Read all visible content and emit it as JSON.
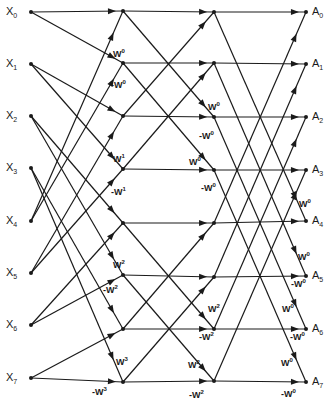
{
  "diagram": {
    "stroke_color": "#1a1a1a",
    "background": "#ffffff",
    "columns_x": [
      31,
      123,
      214,
      306
    ],
    "rows_y": {
      "inputs": [
        12,
        64,
        116,
        168,
        221,
        273,
        325,
        378
      ],
      "stage1": [
        11,
        63,
        116,
        169,
        223,
        275,
        329,
        382
      ],
      "stage2": [
        12,
        63,
        117,
        170,
        223,
        277,
        329,
        381
      ],
      "outputs": [
        12,
        64,
        117,
        170,
        221,
        276,
        329,
        382
      ]
    },
    "inputs": [
      {
        "base": "X",
        "sub": "0"
      },
      {
        "base": "X",
        "sub": "1"
      },
      {
        "base": "X",
        "sub": "2"
      },
      {
        "base": "X",
        "sub": "3"
      },
      {
        "base": "X",
        "sub": "4"
      },
      {
        "base": "X",
        "sub": "5"
      },
      {
        "base": "X",
        "sub": "6"
      },
      {
        "base": "X",
        "sub": "7"
      }
    ],
    "outputs": [
      {
        "base": "A",
        "sub": "0"
      },
      {
        "base": "A",
        "sub": "1"
      },
      {
        "base": "A",
        "sub": "2"
      },
      {
        "base": "A",
        "sub": "3"
      },
      {
        "base": "A",
        "sub": "4"
      },
      {
        "base": "A",
        "sub": "5"
      },
      {
        "base": "A",
        "sub": "6"
      },
      {
        "base": "A",
        "sub": "7"
      }
    ],
    "edges": {
      "stage1": [
        [
          0,
          0
        ],
        [
          0,
          1
        ],
        [
          4,
          0
        ],
        [
          4,
          1
        ],
        [
          1,
          2
        ],
        [
          1,
          3
        ],
        [
          5,
          2
        ],
        [
          5,
          3
        ],
        [
          2,
          4
        ],
        [
          2,
          5
        ],
        [
          6,
          4
        ],
        [
          6,
          5
        ],
        [
          3,
          6
        ],
        [
          3,
          7
        ],
        [
          7,
          6
        ],
        [
          7,
          7
        ]
      ],
      "stage2": [
        [
          0,
          0
        ],
        [
          0,
          2
        ],
        [
          2,
          0
        ],
        [
          2,
          2
        ],
        [
          1,
          1
        ],
        [
          1,
          3
        ],
        [
          3,
          1
        ],
        [
          3,
          3
        ],
        [
          4,
          4
        ],
        [
          4,
          6
        ],
        [
          6,
          4
        ],
        [
          6,
          6
        ],
        [
          5,
          5
        ],
        [
          5,
          7
        ],
        [
          7,
          5
        ],
        [
          7,
          7
        ]
      ],
      "stage3": [
        [
          0,
          0
        ],
        [
          0,
          4
        ],
        [
          4,
          0
        ],
        [
          4,
          4
        ],
        [
          1,
          1
        ],
        [
          1,
          5
        ],
        [
          5,
          1
        ],
        [
          5,
          5
        ],
        [
          2,
          2
        ],
        [
          2,
          6
        ],
        [
          6,
          2
        ],
        [
          6,
          6
        ],
        [
          3,
          3
        ],
        [
          3,
          7
        ],
        [
          7,
          3
        ],
        [
          7,
          7
        ]
      ]
    },
    "twiddle_labels": [
      {
        "sign": "",
        "exp": "0",
        "x": 113,
        "y": 57
      },
      {
        "sign": "-",
        "exp": "0",
        "x": 111,
        "y": 88
      },
      {
        "sign": "",
        "exp": "1",
        "x": 113,
        "y": 162
      },
      {
        "sign": "-",
        "exp": "1",
        "x": 111,
        "y": 195
      },
      {
        "sign": "",
        "exp": "2",
        "x": 113,
        "y": 268
      },
      {
        "sign": "-",
        "exp": "2",
        "x": 103,
        "y": 293
      },
      {
        "sign": "",
        "exp": "3",
        "x": 116,
        "y": 365
      },
      {
        "sign": "-",
        "exp": "3",
        "x": 92,
        "y": 395
      },
      {
        "sign": "",
        "exp": "0",
        "x": 208,
        "y": 110
      },
      {
        "sign": "-",
        "exp": "0",
        "x": 199,
        "y": 139
      },
      {
        "sign": "",
        "exp": "0",
        "x": 189,
        "y": 165
      },
      {
        "sign": "-",
        "exp": "0",
        "x": 201,
        "y": 191
      },
      {
        "sign": "",
        "exp": "2",
        "x": 208,
        "y": 312
      },
      {
        "sign": "-",
        "exp": "2",
        "x": 199,
        "y": 340
      },
      {
        "sign": "",
        "exp": "2",
        "x": 188,
        "y": 368
      },
      {
        "sign": "-",
        "exp": "2",
        "x": 189,
        "y": 398
      },
      {
        "sign": "",
        "exp": "0",
        "x": 299,
        "y": 207
      },
      {
        "sign": "",
        "exp": "0",
        "x": 298,
        "y": 260
      },
      {
        "sign": "-",
        "exp": "0",
        "x": 291,
        "y": 287
      },
      {
        "sign": "",
        "exp": "0",
        "x": 282,
        "y": 312
      },
      {
        "sign": "-",
        "exp": "0",
        "x": 290,
        "y": 340
      },
      {
        "sign": "",
        "exp": "0",
        "x": 281,
        "y": 366
      },
      {
        "sign": "-",
        "exp": "0",
        "x": 281,
        "y": 397
      }
    ],
    "twiddle_base": "W"
  }
}
